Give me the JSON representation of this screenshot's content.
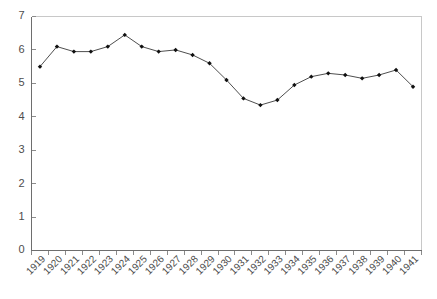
{
  "chart_data": {
    "type": "line",
    "title": "",
    "subtitle": "",
    "xlabel": "",
    "ylabel": "",
    "categories": [
      "1919",
      "1920",
      "1921",
      "1922",
      "1923",
      "1924",
      "1925",
      "1926",
      "1927",
      "1928",
      "1929",
      "1930",
      "1931",
      "1932",
      "1933",
      "1934",
      "1935",
      "1936",
      "1937",
      "1938",
      "1939",
      "1940",
      "1941"
    ],
    "values": [
      5.5,
      6.1,
      5.95,
      5.95,
      6.1,
      6.45,
      6.1,
      5.95,
      6.0,
      5.85,
      5.6,
      5.1,
      4.55,
      4.35,
      4.5,
      4.95,
      5.2,
      5.3,
      5.25,
      5.15,
      5.25,
      5.4,
      4.9
    ],
    "series": [
      {
        "name": "",
        "values": [
          5.5,
          6.1,
          5.95,
          5.95,
          6.1,
          6.45,
          6.1,
          5.95,
          6.0,
          5.85,
          5.6,
          5.1,
          4.55,
          4.35,
          4.5,
          4.95,
          5.2,
          5.3,
          5.25,
          5.15,
          5.25,
          5.4,
          4.9
        ],
        "marker": "filled-diamond",
        "color": "#101010"
      }
    ],
    "ylim": [
      0,
      7
    ],
    "yticks": [
      0,
      1,
      2,
      3,
      4,
      5,
      6,
      7
    ],
    "ytick_labels": [
      "0",
      "1",
      "2",
      "3",
      "4",
      "5",
      "6",
      "7"
    ],
    "xtick_labels": [
      "1919",
      "1920",
      "1921",
      "1922",
      "1923",
      "1924",
      "1925",
      "1926",
      "1927",
      "1928",
      "1929",
      "1930",
      "1931",
      "1932",
      "1933",
      "1934",
      "1935",
      "1936",
      "1937",
      "1938",
      "1939",
      "1940",
      "1941"
    ],
    "xtick_rotation": 45,
    "grid": false,
    "legend": false,
    "legend_position": "none",
    "annotations": []
  },
  "style": {
    "line_color": "#3a3a3a",
    "marker_color": "#101010",
    "axis_color": "#6e6e6e",
    "frame_color": "#c8c8c8",
    "tick_color": "#8c8c8c",
    "label_color": "#4d4d4d",
    "background": "#ffffff"
  }
}
